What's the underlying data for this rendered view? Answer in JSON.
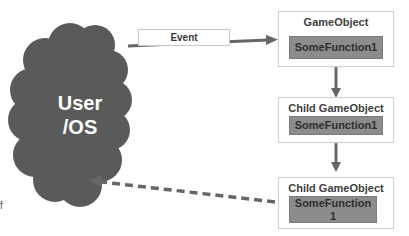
{
  "diagram": {
    "cloud": {
      "label_line1": "User",
      "label_line2": "/OS",
      "color": "#5a5a5a"
    },
    "event_arrow": {
      "label": "Event"
    },
    "nodes": [
      {
        "title": "GameObject",
        "function": "SomeFunction1"
      },
      {
        "title": "Child GameObject",
        "function": "SomeFunction1"
      },
      {
        "title": "Child GameObject",
        "function_line1": "SomeFunction",
        "function_line2": "1"
      }
    ],
    "return_arrow": {
      "style": "dashed"
    },
    "stray_text": "f",
    "colors": {
      "arrow": "#666666",
      "function_fill": "#8c8c8c",
      "box_border": "#cfcfcf"
    }
  }
}
